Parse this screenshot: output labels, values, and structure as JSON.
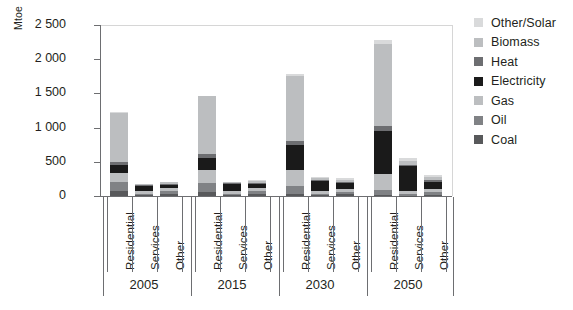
{
  "chart_data": {
    "type": "bar",
    "title": "",
    "subtitle": "",
    "stacked": true,
    "xlabel": "",
    "ylabel": "Mtoe",
    "ylim": [
      0,
      2500
    ],
    "yticks": [
      0,
      500,
      1000,
      1500,
      2000,
      2500
    ],
    "ytick_labels": [
      "0",
      "500",
      "1 000",
      "1 500",
      "2 000",
      "2 500"
    ],
    "grid": false,
    "legend_position": "right",
    "categories": [
      "Residential",
      "Services",
      "Other",
      "Residential",
      "Services",
      "Other",
      "Residential",
      "Services",
      "Other",
      "Residential",
      "Services",
      "Other"
    ],
    "groups": [
      {
        "label": "2005",
        "categories": [
          "Residential",
          "Services",
          "Other"
        ]
      },
      {
        "label": "2015",
        "categories": [
          "Residential",
          "Services",
          "Other"
        ]
      },
      {
        "label": "2030",
        "categories": [
          "Residential",
          "Services",
          "Other"
        ]
      },
      {
        "label": "2050",
        "categories": [
          "Residential",
          "Services",
          "Other"
        ]
      }
    ],
    "series": [
      {
        "name": "Coal",
        "color": "#58595b",
        "values": [
          75,
          10,
          35,
          55,
          10,
          30,
          30,
          10,
          25,
          15,
          5,
          20
        ]
      },
      {
        "name": "Oil",
        "color": "#808285",
        "values": [
          135,
          25,
          45,
          135,
          25,
          45,
          115,
          25,
          40,
          70,
          20,
          35
        ]
      },
      {
        "name": "Gas",
        "color": "#bcbec0",
        "values": [
          130,
          35,
          35,
          195,
          40,
          40,
          235,
          45,
          45,
          240,
          50,
          45
        ]
      },
      {
        "name": "Electricity",
        "color": "#1a1a1a",
        "values": [
          115,
          75,
          45,
          175,
          95,
          55,
          360,
          135,
          75,
          630,
          360,
          110
        ]
      },
      {
        "name": "Heat",
        "color": "#6d6e71",
        "values": [
          45,
          15,
          20,
          60,
          15,
          20,
          70,
          20,
          20,
          75,
          25,
          20
        ]
      },
      {
        "name": "Biomass",
        "color": "#bcbec0",
        "values": [
          720,
          10,
          20,
          840,
          15,
          25,
          950,
          25,
          30,
          1200,
          60,
          45
        ]
      },
      {
        "name": "Other/Solar",
        "color": "#d9dadb",
        "values": [
          5,
          5,
          10,
          10,
          10,
          15,
          30,
          25,
          25,
          45,
          40,
          35
        ]
      }
    ],
    "totals": [
      1225,
      175,
      210,
      1470,
      210,
      230,
      1790,
      285,
      260,
      2275,
      560,
      310
    ],
    "legend": [
      {
        "label": "Other/Solar",
        "color": "#d9dadb"
      },
      {
        "label": "Biomass",
        "color": "#bcbec0"
      },
      {
        "label": "Heat",
        "color": "#6d6e71"
      },
      {
        "label": "Electricity",
        "color": "#1a1a1a"
      },
      {
        "label": "Gas",
        "color": "#bcbec0"
      },
      {
        "label": "Oil",
        "color": "#808285"
      },
      {
        "label": "Coal",
        "color": "#58595b"
      }
    ]
  }
}
